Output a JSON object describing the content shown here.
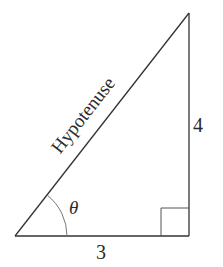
{
  "diagram": {
    "type": "right-triangle",
    "labels": {
      "hypotenuse": "Hypotenuse",
      "angle": "θ",
      "adjacent_side": "3",
      "opposite_side": "4"
    },
    "colors": {
      "stroke": "#333333",
      "arc": "#777777",
      "background": "#ffffff"
    }
  }
}
